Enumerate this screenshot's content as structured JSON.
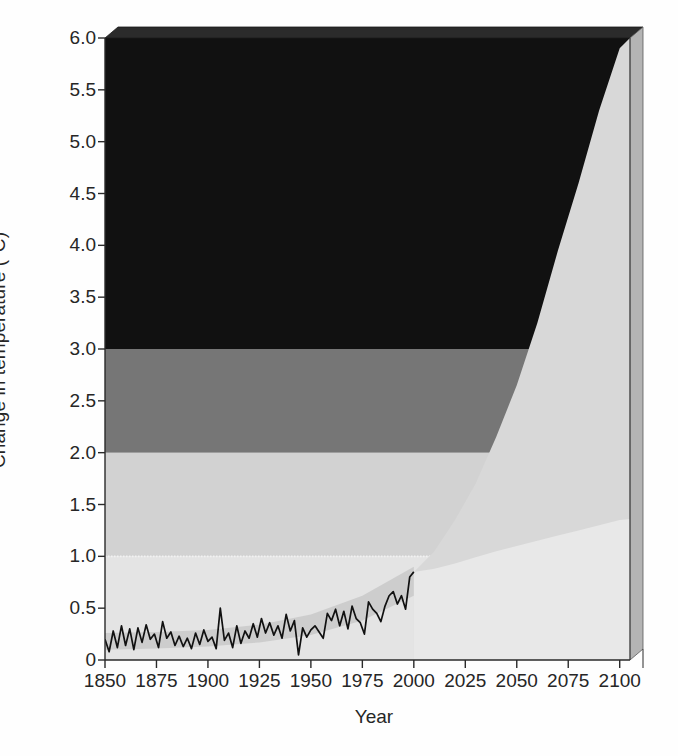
{
  "chart_data": {
    "type": "area",
    "title": "",
    "xlabel": "Year",
    "ylabel": "Change in temperature (°C)",
    "xlim": [
      1850,
      2105
    ],
    "ylim": [
      0,
      6.0
    ],
    "grid": false,
    "legend_position": "none",
    "x_ticks": [
      1850,
      1875,
      1900,
      1925,
      1950,
      1975,
      2000,
      2025,
      2050,
      2075,
      2100
    ],
    "x_tick_labels": [
      "1850",
      "1875",
      "1900",
      "1925",
      "1950",
      "1975",
      "2000",
      "2025",
      "2050",
      "2075",
      "2100"
    ],
    "y_ticks": [
      0,
      0.5,
      1.0,
      1.5,
      2.0,
      2.5,
      3.0,
      3.5,
      4.0,
      4.5,
      5.0,
      5.5,
      6.0
    ],
    "y_tick_labels": [
      "0",
      "0.5",
      "1.0",
      "1.5",
      "2.0",
      "2.5",
      "3.0",
      "3.5",
      "4.0",
      "4.5",
      "5.0",
      "5.5",
      "6.0"
    ],
    "background_bands": [
      {
        "name": "band-0-1",
        "from": 0.0,
        "to": 1.0,
        "color": "#e4e4e4"
      },
      {
        "name": "band-1-2",
        "from": 1.0,
        "to": 2.0,
        "color": "#d2d2d2"
      },
      {
        "name": "band-2-3",
        "from": 2.0,
        "to": 3.0,
        "color": "#767676"
      },
      {
        "name": "band-3-6",
        "from": 3.0,
        "to": 6.0,
        "color": "#111111"
      }
    ],
    "series": [
      {
        "name": "Observed temperature",
        "kind": "line",
        "color": "#111111",
        "x": [
          1850,
          1852,
          1854,
          1856,
          1858,
          1860,
          1862,
          1864,
          1866,
          1868,
          1870,
          1872,
          1874,
          1876,
          1878,
          1880,
          1882,
          1884,
          1886,
          1888,
          1890,
          1892,
          1894,
          1896,
          1898,
          1900,
          1902,
          1904,
          1906,
          1908,
          1910,
          1912,
          1914,
          1916,
          1918,
          1920,
          1922,
          1924,
          1926,
          1928,
          1930,
          1932,
          1934,
          1936,
          1938,
          1940,
          1942,
          1944,
          1946,
          1948,
          1950,
          1952,
          1954,
          1956,
          1958,
          1960,
          1962,
          1964,
          1966,
          1968,
          1970,
          1972,
          1974,
          1976,
          1978,
          1980,
          1982,
          1984,
          1986,
          1988,
          1990,
          1992,
          1994,
          1996,
          1998,
          2000
        ],
        "y": [
          0.2,
          0.08,
          0.28,
          0.12,
          0.33,
          0.14,
          0.3,
          0.1,
          0.31,
          0.17,
          0.34,
          0.2,
          0.25,
          0.12,
          0.37,
          0.21,
          0.27,
          0.14,
          0.23,
          0.13,
          0.21,
          0.11,
          0.26,
          0.15,
          0.29,
          0.18,
          0.22,
          0.11,
          0.5,
          0.19,
          0.26,
          0.12,
          0.33,
          0.16,
          0.28,
          0.21,
          0.35,
          0.22,
          0.4,
          0.26,
          0.36,
          0.24,
          0.33,
          0.21,
          0.44,
          0.28,
          0.38,
          0.05,
          0.31,
          0.22,
          0.29,
          0.33,
          0.27,
          0.21,
          0.45,
          0.38,
          0.49,
          0.33,
          0.47,
          0.3,
          0.52,
          0.4,
          0.36,
          0.25,
          0.56,
          0.49,
          0.45,
          0.37,
          0.52,
          0.62,
          0.66,
          0.54,
          0.62,
          0.49,
          0.8,
          0.85
        ]
      },
      {
        "name": "Projection upper bound",
        "kind": "envelope-upper",
        "x": [
          2000,
          2010,
          2020,
          2030,
          2040,
          2050,
          2060,
          2070,
          2080,
          2090,
          2100,
          2105
        ],
        "y": [
          0.85,
          1.05,
          1.35,
          1.7,
          2.15,
          2.65,
          3.25,
          3.95,
          4.6,
          5.3,
          5.9,
          6.0
        ]
      },
      {
        "name": "Projection lower bound",
        "kind": "envelope-lower",
        "x": [
          2000,
          2010,
          2020,
          2030,
          2040,
          2050,
          2060,
          2070,
          2080,
          2090,
          2100,
          2105
        ],
        "y": [
          0.85,
          0.88,
          0.93,
          0.99,
          1.05,
          1.1,
          1.15,
          1.2,
          1.25,
          1.3,
          1.35,
          1.36
        ]
      },
      {
        "name": "Historical uncertainty band",
        "kind": "envelope-historical",
        "x": [
          1850,
          1875,
          1900,
          1925,
          1950,
          1975,
          2000
        ],
        "y_lower": [
          0.1,
          0.11,
          0.13,
          0.17,
          0.24,
          0.38,
          0.62
        ],
        "y_upper": [
          0.26,
          0.27,
          0.29,
          0.34,
          0.44,
          0.62,
          0.9
        ]
      }
    ],
    "projection_wedge_start_year": 2000,
    "projection_fill_color": "#d8d8d8",
    "annotations": []
  },
  "axes": {
    "y_axis_title": "Change in temperature (°C)",
    "x_axis_title": "Year"
  },
  "colors": {
    "band_low": "#e4e4e4",
    "band_mid_low": "#d2d2d2",
    "band_mid_high": "#767676",
    "band_high": "#111111",
    "observed_line": "#111111",
    "projection_fill": "#d8d8d8",
    "axis": "#2a2a2a",
    "panel_side": "#b4b4b4",
    "background": "#fefefe"
  }
}
